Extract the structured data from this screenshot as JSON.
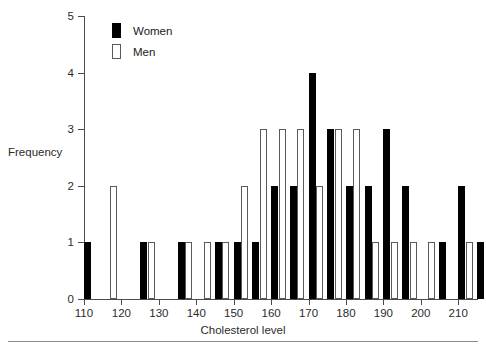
{
  "chart_data": {
    "type": "bar",
    "title": "",
    "xlabel": "Cholesterol level",
    "ylabel": "Frequency",
    "grid": false,
    "legend_position": "top-left",
    "xlim": [
      110,
      217
    ],
    "ylim": [
      0,
      5
    ],
    "ytick_labels": [
      "0",
      "1",
      "2",
      "3",
      "4",
      "5"
    ],
    "ytick_values": [
      0,
      1,
      2,
      3,
      4,
      5
    ],
    "xtick_labels": [
      "110",
      "120",
      "130",
      "140",
      "150",
      "160",
      "170",
      "180",
      "190",
      "200",
      "210"
    ],
    "xtick_values": [
      110,
      120,
      130,
      140,
      150,
      160,
      170,
      180,
      190,
      200,
      210
    ],
    "categories": [
      110,
      115,
      120,
      125,
      130,
      135,
      140,
      145,
      150,
      155,
      160,
      165,
      170,
      175,
      180,
      185,
      190,
      195,
      200,
      205,
      210,
      215
    ],
    "series": [
      {
        "name": "Women",
        "color": "#000000",
        "values": [
          1,
          0,
          0,
          1,
          0,
          1,
          0,
          1,
          1,
          1,
          2,
          2,
          4,
          3,
          2,
          2,
          3,
          2,
          0,
          1,
          2,
          1
        ]
      },
      {
        "name": "Men",
        "color": "#ffffff",
        "values": [
          0,
          2,
          0,
          1,
          0,
          1,
          1,
          1,
          2,
          3,
          3,
          3,
          2,
          3,
          3,
          1,
          1,
          1,
          1,
          0,
          1,
          0
        ]
      }
    ]
  },
  "legend": {
    "items": [
      {
        "label": "Women",
        "style": "filled-black"
      },
      {
        "label": "Men",
        "style": "outlined-white"
      }
    ]
  },
  "axes": {
    "x_title": "Cholesterol level",
    "y_title": "Frequency"
  },
  "colors": {
    "women": "#000000",
    "men": "#ffffff",
    "men_outline": "#5a5a5a",
    "axis": "#4c4c4c",
    "text": "#2b2b2b",
    "background": "#ffffff",
    "rule": "#8c8c8c"
  }
}
